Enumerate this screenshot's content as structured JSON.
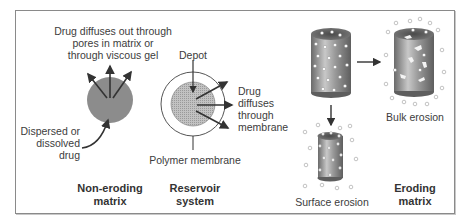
{
  "figure": {
    "panels": [
      {
        "id": "non-eroding-matrix",
        "title_line1": "Non-eroding",
        "title_line2": "matrix",
        "top_label_line1": "Drug diffuses out through",
        "top_label_line2": "pores in matrix or",
        "top_label_line3": "through viscous gel",
        "side_label_line1": "Dispersed or",
        "side_label_line2": "dissolved",
        "side_label_line3": "drug"
      },
      {
        "id": "reservoir-system",
        "title_line1": "Reservoir",
        "title_line2": "system",
        "depot_label": "Depot",
        "diffuse_label_line1": "Drug",
        "diffuse_label_line2": "diffuses",
        "diffuse_label_line3": "through",
        "diffuse_label_line4": "membrane",
        "membrane_label": "Polymer membrane"
      },
      {
        "id": "eroding-matrix",
        "title_line1": "Eroding",
        "title_line2": "matrix",
        "bulk_label": "Bulk erosion",
        "surface_label": "Surface erosion"
      }
    ],
    "colors": {
      "matrix_fill": "#8c8c8c",
      "depot_fill": "#bdbdbd",
      "cylinder_dark": "#6e6e6e",
      "cylinder_light": "#c4c4c4",
      "arrow": "#333333",
      "frame": "#8a8a8a"
    }
  }
}
